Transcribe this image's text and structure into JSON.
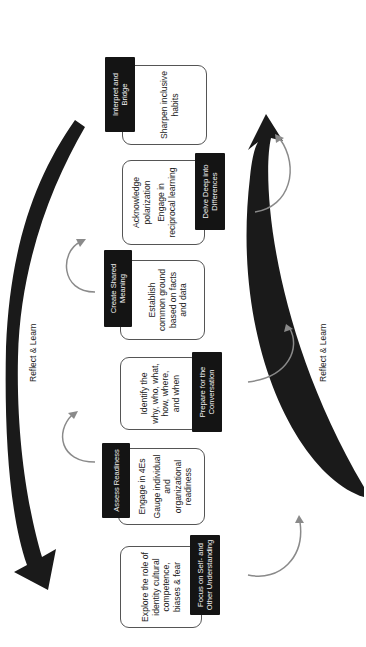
{
  "diagram": {
    "title": "",
    "orientation": "rotated-90-ccw",
    "colors": {
      "header_bg": "#141414",
      "header_text": "#f2f2f2",
      "card_border": "#555555",
      "small_arrow": "#8a8a8a",
      "big_arrow": "#1a1a1a"
    },
    "cycle_labels": {
      "top": "Reflect & Learn",
      "bottom": "Reflect & Learn"
    },
    "steps": [
      {
        "header": "Focus on Self- and Other Understanding",
        "header_position": "below",
        "body": [
          "Explore the role of identity cultural competence, biases & fear"
        ]
      },
      {
        "header": "Assess Readiness",
        "header_position": "above",
        "body": [
          "Engage in 4Es",
          "Gauge individual and organizational readiness"
        ]
      },
      {
        "header": "Prepare for the Conversation",
        "header_position": "below",
        "body": [
          "Identify the why, who, what, how, where, and when"
        ]
      },
      {
        "header": "Create Shared Meaning",
        "header_position": "above",
        "body": [
          "Establish common ground based on facts and data"
        ]
      },
      {
        "header": "Delve Deep into Differences",
        "header_position": "below",
        "body": [
          "Acknowledge polarization",
          "Engage in reciprocal learning"
        ]
      },
      {
        "header": "Interpret and Bridge",
        "header_position": "above",
        "body": [
          "Sharpen inclusive habits"
        ]
      }
    ]
  }
}
